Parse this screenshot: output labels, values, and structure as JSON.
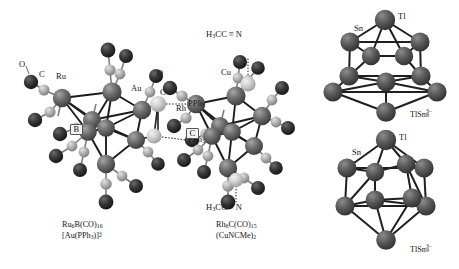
{
  "figure": {
    "background": "#ffffff",
    "ink": "#141414",
    "panels": [
      {
        "id": "ru6b",
        "name": "ruthenium-boride-carbonyl-gold-cluster",
        "caption_line1": "Ru6B(CO)16",
        "caption_line2": "[Au(PPh3)]2-",
        "atom_labels": [
          "O",
          "C",
          "Ru",
          "Au",
          "B"
        ],
        "ligand_labels": [
          "PPh3",
          "PPh3"
        ]
      },
      {
        "id": "rh6c",
        "name": "rhodium-carbide-carbonyl-copper-acetonitrile-cluster",
        "caption_line1": "Rh6C(CO)15",
        "caption_line2": "(CuNCMe)2",
        "atom_labels": [
          "O",
          "C",
          "Cu",
          "Rh"
        ],
        "ligand_labels": [
          "H3CC=N",
          "H3CC=N"
        ]
      },
      {
        "id": "tlsn8",
        "name": "thallium-tin-eight-zintl-anion",
        "caption": "TlSn8 3-",
        "atom_labels": [
          "Sn",
          "Tl"
        ]
      },
      {
        "id": "tlsn9",
        "name": "thallium-tin-nine-zintl-anion",
        "caption": "TlSn9 3-",
        "atom_labels": [
          "Sn",
          "Tl"
        ]
      }
    ]
  },
  "labels": {
    "left": {
      "O": "O",
      "C": "C",
      "Ru": "Ru",
      "Au": "Au",
      "B": "B",
      "PPh3_top": "PPh",
      "PPh3_top_sub": "3",
      "PPh3_bottom": "PPh",
      "PPh3_bottom_sub": "3"
    },
    "middle": {
      "nitrile_top_pre": "H",
      "nitrile_top_pre_sub": "3",
      "nitrile_top_mid": "CC",
      "nitrile_top_bond": "≡",
      "nitrile_top_end": "N",
      "nitrile_bottom_pre": "H",
      "nitrile_bottom_pre_sub": "3",
      "nitrile_bottom_mid": "CC",
      "nitrile_bottom_bond": "≡",
      "nitrile_bottom_end": "N",
      "O": "O",
      "C_ligand": "C",
      "Cu": "Cu",
      "Rh": "Rh",
      "C_interstitial": "C"
    },
    "right_top": {
      "Sn": "Sn",
      "Tl": "Tl"
    },
    "right_bottom": {
      "Sn": "Sn",
      "Tl": "Tl"
    }
  },
  "captions": {
    "left": {
      "l1_main": "Ru",
      "l1_sub1": "6",
      "l1_mid": "B(CO)",
      "l1_sub2": "16",
      "l2_main": "[Au(PPh",
      "l2_sub1": "3",
      "l2_mid": ")]",
      "l2_sub2": "2",
      "l2_sup": "−"
    },
    "middle": {
      "l1_main": "Rh",
      "l1_sub1": "6",
      "l1_mid": "C(CO)",
      "l1_sub2": "15",
      "l2_text": "(CuNCMe)",
      "l2_sub": "2"
    },
    "right_top": {
      "main": "TlSn",
      "sub": "8",
      "sup": "3−"
    },
    "right_bottom": {
      "main": "TlSn",
      "sub": "9",
      "sup": "3−"
    }
  },
  "colors": {
    "dark_atom": "#2a2a2a",
    "mid_atom": "#5e5e5e",
    "light_atom": "#a8a8a8",
    "pale_atom": "#cccccc",
    "bond": "#1e1e1e",
    "bond_light": "#8a8a8a",
    "highlight": "#e8e8e8"
  }
}
